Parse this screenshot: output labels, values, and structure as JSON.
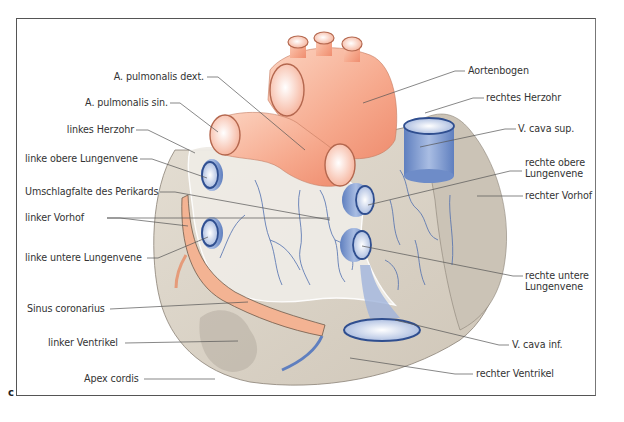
{
  "figure": {
    "panel_letter": "c",
    "colors": {
      "artery": "#f4a58a",
      "artery_light": "#fde0d2",
      "vein": "#7f9bd0",
      "vein_dark": "#3a5a9a",
      "myocardium": "#d8d0c4",
      "atrium": "#cbc3b6",
      "pericardial_fold": "#f3f1ec",
      "leader_line": "#555555",
      "frame": "#555555"
    }
  },
  "labels_left": [
    {
      "id": "a-pulmonalis-dext",
      "text": "A. pulmonalis dext."
    },
    {
      "id": "a-pulmonalis-sin",
      "text": "A. pulmonalis sin."
    },
    {
      "id": "linkes-herzohr",
      "text": "linkes Herzohr"
    },
    {
      "id": "linke-obere-lungenvene",
      "text": "linke obere Lungenvene"
    },
    {
      "id": "umschlagfalte",
      "text": "Umschlagfalte des Perikards"
    },
    {
      "id": "linker-vorhof",
      "text": "linker Vorhof"
    },
    {
      "id": "linke-untere-lungenvene",
      "text": "linke untere Lungenvene"
    },
    {
      "id": "sinus-coronarius",
      "text": "Sinus coronarius"
    },
    {
      "id": "linker-ventrikel",
      "text": "linker Ventrikel"
    },
    {
      "id": "apex-cordis",
      "text": "Apex cordis"
    }
  ],
  "labels_right": [
    {
      "id": "aortenbogen",
      "text": "Aortenbogen"
    },
    {
      "id": "rechtes-herzohr",
      "text": "rechtes Herzohr"
    },
    {
      "id": "v-cava-sup",
      "text": "V. cava sup."
    },
    {
      "id": "rechte-obere-lungenvene-1",
      "text": "rechte obere"
    },
    {
      "id": "rechte-obere-lungenvene-2",
      "text": "Lungenvene"
    },
    {
      "id": "rechter-vorhof",
      "text": "rechter Vorhof"
    },
    {
      "id": "rechte-untere-lungenvene-1",
      "text": "rechte untere"
    },
    {
      "id": "rechte-untere-lungenvene-2",
      "text": "Lungenvene"
    },
    {
      "id": "v-cava-inf",
      "text": "V. cava inf."
    },
    {
      "id": "rechter-ventrikel",
      "text": "rechter Ventrikel"
    }
  ]
}
